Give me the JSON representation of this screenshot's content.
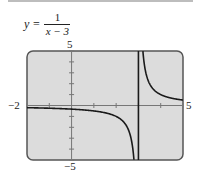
{
  "equation": {
    "lhs": "y =",
    "numerator": "1",
    "denominator": "x − 3"
  },
  "chart_data": {
    "type": "line",
    "xlabel": "",
    "ylabel": "",
    "xlim": [
      -2,
      5
    ],
    "ylim": [
      -5,
      5
    ],
    "x_tick_step": 1,
    "y_tick_step": 1,
    "tick_labels": {
      "xmin": "−2",
      "xmax": "5",
      "ymax": "5",
      "ymin": "−5"
    },
    "vertical_asymptote": 3,
    "grid": false,
    "series": [
      {
        "name": "y = 1/(x-3)",
        "function": "1/(x-3)",
        "x": [
          -2,
          -1,
          0,
          1,
          2,
          2.5,
          2.8,
          3.2,
          3.5,
          4,
          5
        ],
        "values": [
          -0.2,
          -0.25,
          -0.333,
          -0.5,
          -1,
          -2,
          -5,
          5,
          2,
          1,
          0.5
        ]
      }
    ]
  },
  "colors": {
    "screen": "#dcdcdc",
    "border": "#555555",
    "curve": "#1a1a1a"
  }
}
